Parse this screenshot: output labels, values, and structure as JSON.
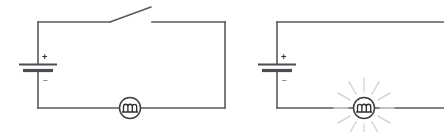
{
  "diagram": {
    "background_color": "#ffffff",
    "wire_color": "#5a5a5e",
    "ray_color": "#d8d8dc",
    "label_color": "#2b2b2f",
    "circuits": [
      {
        "id": "left-circuit",
        "name": "Open circuit with unlit lamp",
        "battery": {
          "name": "cell",
          "plus_label": "+",
          "minus_label": "–"
        },
        "switch": {
          "name": "switch",
          "state": "open"
        },
        "lamp": {
          "name": "lamp",
          "state": "off",
          "lit": false
        }
      },
      {
        "id": "right-circuit",
        "name": "Closed circuit with lit lamp",
        "battery": {
          "name": "cell",
          "plus_label": "+",
          "minus_label": "–"
        },
        "switch": null,
        "lamp": {
          "name": "lamp",
          "state": "on",
          "lit": true,
          "ray_count": 12
        }
      }
    ]
  }
}
